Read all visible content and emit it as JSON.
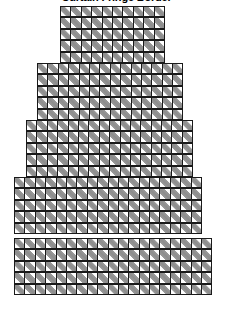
{
  "title": "Curtain Fringe Border",
  "colors": {
    "grid_line": "#1a1a1a",
    "stitch_fill": "#8c8c8c",
    "background": "#ffffff"
  },
  "chart_data": {
    "type": "heatmap",
    "title": "Curtain Fringe Border",
    "xlabel": "",
    "ylabel": "",
    "cell_size_px": 11.4,
    "symbols": {
      "filled": "diagonal-hatch",
      "empty": "blank"
    },
    "tiers": [
      {
        "name": "tier-1-top",
        "rows": 5,
        "cols": 10,
        "left_col": 5,
        "top_row": 0,
        "x_px": 60,
        "y_px": 6
      },
      {
        "name": "tier-2",
        "rows": 5,
        "cols": 14,
        "left_col": 3,
        "top_row": 5,
        "x_px": 37,
        "y_px": 63
      },
      {
        "name": "tier-3",
        "rows": 5,
        "cols": 16,
        "left_col": 2,
        "top_row": 10,
        "x_px": 26,
        "y_px": 120
      },
      {
        "name": "tier-4",
        "rows": 5,
        "cols": 18,
        "left_col": 1,
        "top_row": 15,
        "x_px": 14,
        "y_px": 177
      },
      {
        "name": "tier-5-bottom",
        "rows": 5,
        "cols": 19,
        "left_col": 0,
        "top_row": 20,
        "x_px": 14,
        "y_px": 238
      }
    ],
    "total_rows": 25,
    "max_cols": 19,
    "grid": "on",
    "legend": "none"
  }
}
